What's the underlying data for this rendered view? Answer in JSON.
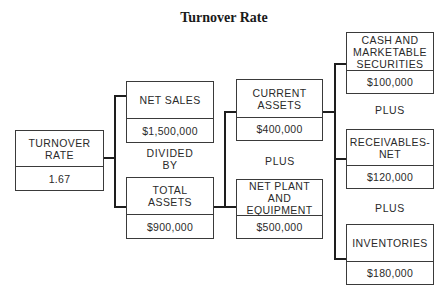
{
  "title": "Turnover Rate",
  "boxes": {
    "turnover_rate": {
      "label": "TURNOVER RATE",
      "value": "1.67"
    },
    "net_sales": {
      "label": "NET SALES",
      "value": "$1,500,000"
    },
    "total_assets": {
      "label": "TOTAL ASSETS",
      "value": "$900,000"
    },
    "current_assets": {
      "label": "CURRENT ASSETS",
      "value": "$400,000"
    },
    "net_plant": {
      "label": "NET PLANT AND EQUIPMENT",
      "value": "$500,000"
    },
    "cash": {
      "label": "CASH AND MARKETABLE SECURITIES",
      "value": "$100,000"
    },
    "receivables": {
      "label": "RECEIVABLES-NET",
      "value": "$120,000"
    },
    "inventories": {
      "label": "INVENTORIES",
      "value": "$180,000"
    }
  },
  "operators": {
    "divided_by": "DIVIDED BY",
    "plus_assets": "PLUS",
    "plus_1": "PLUS",
    "plus_2": "PLUS"
  },
  "colors": {
    "line": "#1e1e1e",
    "border": "#3a3a3a",
    "text": "#2a2a2a"
  }
}
